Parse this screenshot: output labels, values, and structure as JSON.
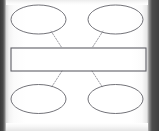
{
  "document": {
    "kind": "graphic-organizer-worksheet",
    "title": "",
    "canvas": {
      "width": 159,
      "height": 131
    },
    "background_color": "#ffffff",
    "paper_color": "#fdfdfd",
    "scan_edge_color": "#3f3f3f"
  },
  "style": {
    "shape_stroke_color": "#63636a",
    "rect_stroke_color": "#5f5f66",
    "connector_color": "#8d8d93",
    "shape_fill": "#ffffff"
  },
  "diagram": {
    "type": "concept-map",
    "center_node": {
      "id": "center-rectangle",
      "shape": "rectangle",
      "text": "",
      "x": 11,
      "y": 48,
      "width": 135,
      "height": 23
    },
    "nodes": [
      {
        "id": "node-top-left",
        "shape": "ellipse",
        "text": "",
        "cx": 38.5,
        "cy": 19.5,
        "rx": 27.5,
        "ry": 14.5
      },
      {
        "id": "node-top-right",
        "shape": "ellipse",
        "text": "",
        "cx": 115.5,
        "cy": 19.5,
        "rx": 27.5,
        "ry": 14.5
      },
      {
        "id": "node-bottom-left",
        "shape": "ellipse",
        "text": "",
        "cx": 38.5,
        "cy": 99.0,
        "rx": 27.5,
        "ry": 14.5
      },
      {
        "id": "node-bottom-right",
        "shape": "ellipse",
        "text": "",
        "cx": 115.5,
        "cy": 99.0,
        "rx": 27.5,
        "ry": 14.5
      }
    ],
    "connectors": [
      {
        "id": "connector-top-left",
        "from": "node-top-left",
        "to": "center-rectangle",
        "line_style": "dotted",
        "x1": 51,
        "y1": 31,
        "x2": 62,
        "y2": 48
      },
      {
        "id": "connector-top-right",
        "from": "node-top-right",
        "to": "center-rectangle",
        "line_style": "dotted",
        "x1": 103,
        "y1": 31,
        "x2": 92,
        "y2": 48
      },
      {
        "id": "connector-bottom-left",
        "from": "node-bottom-left",
        "to": "center-rectangle",
        "line_style": "dotted",
        "x1": 62,
        "y1": 71,
        "x2": 51,
        "y2": 88
      },
      {
        "id": "connector-bottom-right",
        "from": "node-bottom-right",
        "to": "center-rectangle",
        "line_style": "dotted",
        "x1": 92,
        "y1": 71,
        "x2": 103,
        "y2": 88
      }
    ]
  }
}
